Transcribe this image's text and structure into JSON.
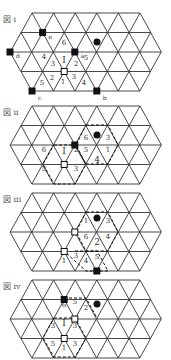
{
  "figures": [
    {
      "label": "図 i",
      "top": 13,
      "black_squares": [
        {
          "v": [
            1,
            1
          ],
          "tag": "e"
        },
        {
          "v": [
            2,
            0
          ],
          "tag": "d"
        },
        {
          "v": [
            2,
            3
          ],
          "tag": "a"
        },
        {
          "v": [
            4,
            0
          ],
          "tag": "c"
        },
        {
          "v": [
            4,
            3
          ],
          "tag": "b"
        }
      ],
      "white_squares": [
        [
          3,
          2
        ]
      ],
      "black_circles": [
        [
          97,
          29
        ]
      ],
      "texts": [
        {
          "x": 64,
          "y": 32,
          "t": "6",
          "cls": "num"
        },
        {
          "x": 64,
          "y": 50,
          "t": "I",
          "cls": "big"
        },
        {
          "x": 44,
          "y": 46,
          "t": "4",
          "cls": "num"
        },
        {
          "x": 53,
          "y": 53,
          "t": "3",
          "cls": "num"
        },
        {
          "x": 76,
          "y": 53,
          "t": "2",
          "cls": "num"
        },
        {
          "x": 86,
          "y": 47,
          "t": "5",
          "cls": "num"
        },
        {
          "x": 42,
          "y": 72,
          "t": "5",
          "cls": "num"
        },
        {
          "x": 52,
          "y": 67,
          "t": "2",
          "cls": "num"
        },
        {
          "x": 63,
          "y": 71,
          "t": "1",
          "cls": "num"
        },
        {
          "x": 74,
          "y": 66,
          "t": "3",
          "cls": "num"
        },
        {
          "x": 84,
          "y": 72,
          "t": "4",
          "cls": "num"
        }
      ],
      "dashed": []
    },
    {
      "label": "図 ii",
      "top": 106,
      "black_squares": [
        {
          "v": [
            2,
            3
          ],
          "tag": ""
        }
      ],
      "white_squares": [
        [
          3,
          2
        ]
      ],
      "black_circles": [
        [
          97,
          29
        ]
      ],
      "texts": [
        {
          "x": 64,
          "y": 48,
          "t": "I",
          "cls": "big"
        },
        {
          "x": 97,
          "y": 57,
          "t": "4",
          "cls": "big"
        },
        {
          "x": 86,
          "y": 34,
          "t": "6",
          "cls": "num"
        },
        {
          "x": 108,
          "y": 34,
          "t": "3",
          "cls": "num"
        },
        {
          "x": 86,
          "y": 46,
          "t": "5",
          "cls": "num"
        },
        {
          "x": 108,
          "y": 46,
          "t": "1",
          "cls": "num"
        },
        {
          "x": 44,
          "y": 46,
          "t": "6",
          "cls": "num"
        },
        {
          "x": 76,
          "y": 46,
          "t": "2",
          "cls": "num"
        },
        {
          "x": 44,
          "y": 65,
          "t": "5",
          "cls": "num"
        },
        {
          "x": 76,
          "y": 65,
          "t": "3",
          "cls": "num"
        }
      ],
      "dashed": [
        [
          [
            86,
            19
          ],
          [
            108,
            19
          ],
          [
            118,
            39
          ],
          [
            108,
            58
          ],
          [
            86,
            58
          ],
          [
            76,
            39
          ],
          [
            86,
            19
          ]
        ],
        [
          [
            54,
            39
          ],
          [
            75,
            39
          ],
          [
            86,
            58
          ],
          [
            75,
            78
          ],
          [
            54,
            78
          ],
          [
            43,
            58
          ],
          [
            54,
            39
          ]
        ]
      ]
    },
    {
      "label": "図 iii",
      "top": 193,
      "black_squares": [
        {
          "v": [
            4,
            3
          ],
          "tag": ""
        }
      ],
      "white_squares": [
        [
          2,
          3
        ],
        [
          3,
          2
        ]
      ],
      "black_circles": [
        [
          97,
          25
        ]
      ],
      "texts": [
        {
          "x": 97,
          "y": 52,
          "t": "2",
          "cls": "big"
        },
        {
          "x": 86,
          "y": 30,
          "t": "1",
          "cls": "num"
        },
        {
          "x": 108,
          "y": 30,
          "t": "3",
          "cls": "num"
        },
        {
          "x": 86,
          "y": 46,
          "t": "6",
          "cls": "num"
        },
        {
          "x": 108,
          "y": 46,
          "t": "4",
          "cls": "num"
        },
        {
          "x": 76,
          "y": 65,
          "t": "3",
          "cls": "num"
        },
        {
          "x": 86,
          "y": 70,
          "t": "4",
          "cls": "num"
        },
        {
          "x": 97,
          "y": 66,
          "t": "5",
          "cls": "num"
        },
        {
          "x": 64,
          "y": 70,
          "t": "1",
          "cls": "num"
        }
      ],
      "dashed": [
        [
          [
            86,
            19
          ],
          [
            108,
            19
          ],
          [
            118,
            39
          ],
          [
            108,
            58
          ],
          [
            86,
            58
          ],
          [
            76,
            39
          ],
          [
            86,
            19
          ]
        ],
        [
          [
            75,
            58
          ],
          [
            97,
            58
          ],
          [
            108,
            78
          ],
          [
            86,
            78
          ],
          [
            64,
            58
          ]
        ]
      ]
    },
    {
      "label": "図 iv",
      "top": 280,
      "black_squares": [
        {
          "v": [
            1,
            2
          ],
          "tag": ""
        }
      ],
      "white_squares": [
        [
          2,
          3
        ],
        [
          3,
          2
        ]
      ],
      "black_circles": [
        [
          97,
          24
        ]
      ],
      "texts": [
        {
          "x": 64,
          "y": 46,
          "t": "I",
          "cls": "big"
        },
        {
          "x": 64,
          "y": 27,
          "t": "6",
          "cls": "num"
        },
        {
          "x": 75,
          "y": 24,
          "t": "5",
          "cls": "num"
        },
        {
          "x": 86,
          "y": 30,
          "t": "2",
          "cls": "num"
        },
        {
          "x": 53,
          "y": 48,
          "t": "3",
          "cls": "num"
        },
        {
          "x": 75,
          "y": 48,
          "t": "3",
          "cls": "num"
        },
        {
          "x": 53,
          "y": 66,
          "t": "5",
          "cls": "num"
        },
        {
          "x": 64,
          "y": 70,
          "t": "1",
          "cls": "num"
        },
        {
          "x": 75,
          "y": 66,
          "t": "3",
          "cls": "num"
        }
      ],
      "dashed": [
        [
          [
            64,
            18
          ],
          [
            86,
            18
          ],
          [
            97,
            38
          ]
        ],
        [
          [
            54,
            38
          ],
          [
            75,
            38
          ],
          [
            86,
            58
          ],
          [
            75,
            77
          ],
          [
            54,
            77
          ],
          [
            43,
            58
          ],
          [
            54,
            38
          ]
        ]
      ]
    }
  ]
}
